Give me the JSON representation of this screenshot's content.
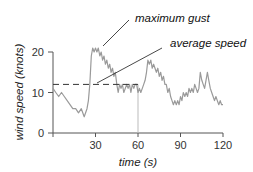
{
  "chart_data": {
    "type": "line",
    "title": "",
    "xlabel": "time (s)",
    "ylabel": "wind speed (knots)",
    "xlim": [
      0,
      120
    ],
    "ylim": [
      0,
      20
    ],
    "xticks": [
      30,
      60,
      90,
      120
    ],
    "yticks": [
      0,
      10,
      20
    ],
    "grid": false,
    "legend": null,
    "series": [
      {
        "name": "wind speed",
        "color": "#9a9a9a",
        "x": [
          0,
          2,
          4,
          6,
          8,
          10,
          12,
          14,
          16,
          18,
          20,
          22,
          24,
          25,
          26,
          27,
          28,
          29,
          30,
          31,
          32,
          33,
          34,
          35,
          36,
          37,
          38,
          39,
          40,
          41,
          42,
          43,
          44,
          45,
          46,
          47,
          48,
          49,
          50,
          51,
          52,
          53,
          54,
          55,
          56,
          57,
          58,
          59,
          60,
          61,
          62,
          63,
          64,
          65,
          66,
          67,
          68,
          69,
          70,
          71,
          72,
          73,
          74,
          75,
          76,
          77,
          78,
          79,
          80,
          81,
          82,
          83,
          84,
          85,
          86,
          87,
          88,
          89,
          90,
          91,
          92,
          93,
          94,
          95,
          96,
          97,
          98,
          99,
          100,
          101,
          102,
          103,
          104,
          105,
          106,
          107,
          108,
          109,
          110,
          111,
          112,
          113,
          114,
          115,
          116,
          117,
          118,
          119,
          120
        ],
        "values": [
          11,
          10,
          9,
          10,
          9,
          8,
          7,
          6,
          6,
          5,
          6,
          4,
          6,
          8,
          12,
          19,
          21,
          20,
          21,
          20,
          21,
          19,
          20,
          18,
          19,
          17,
          18,
          16,
          17,
          15,
          16,
          14,
          15,
          12,
          10,
          12,
          11,
          12,
          10,
          11,
          12,
          11,
          12,
          10,
          12,
          11,
          12,
          12,
          10,
          11,
          10,
          11,
          12,
          13,
          15,
          18,
          17,
          18,
          16,
          17,
          16,
          15,
          16,
          14,
          15,
          13,
          14,
          12,
          12,
          10,
          11,
          9,
          8,
          7,
          8,
          7,
          8,
          7,
          9,
          8,
          10,
          9,
          10,
          9,
          11,
          10,
          11,
          10,
          12,
          11,
          10,
          11,
          15,
          13,
          12,
          11,
          13,
          15,
          13,
          11,
          10,
          9,
          8,
          9,
          8,
          7,
          8,
          7,
          7
        ],
        "style": "solid"
      },
      {
        "name": "average speed",
        "color": "#333333",
        "x": [
          0,
          60
        ],
        "values": [
          12,
          12
        ],
        "style": "dashed"
      }
    ],
    "annotations": [
      {
        "text": "maximum gust",
        "points_to": {
          "x": 31,
          "y": 21
        }
      },
      {
        "text": "average speed",
        "points_to": {
          "x": 27,
          "y": 12
        }
      }
    ],
    "marker_line": {
      "x": 60,
      "from": 0,
      "to": 12,
      "color": "#bbbbbb"
    }
  },
  "axes": {
    "x_title": "time (s)",
    "y_title": "wind speed (knots)",
    "x_tick_labels": [
      "30",
      "60",
      "90",
      "120"
    ],
    "y_tick_labels": [
      "0",
      "10",
      "20"
    ]
  },
  "annotations": {
    "max_gust": "maximum gust",
    "avg_speed": "average speed"
  }
}
